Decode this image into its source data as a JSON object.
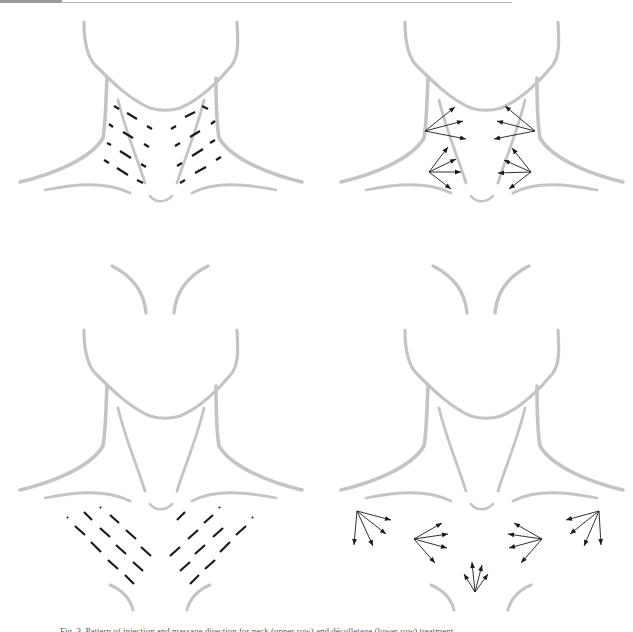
{
  "figure": {
    "caption": "Fig. 3. Pattern of injection and massage direction for neck (upper row) and décolletage (lower row) treatment.",
    "colors": {
      "outline": "#c4c4c4",
      "marks": "#1a1a1a",
      "background": "#ffffff"
    },
    "panels": [
      {
        "id": "top-left",
        "label": "neck-injection-lines",
        "x": 0,
        "y": 0,
        "show_upper_chin": false,
        "dashes": [
          [
            114,
            106,
            119,
            109
          ],
          [
            127,
            113,
            137,
            119
          ],
          [
            147,
            126,
            152,
            129
          ],
          [
            109,
            124,
            113,
            127
          ],
          [
            123,
            132,
            133,
            138
          ],
          [
            144,
            144,
            149,
            147
          ],
          [
            107,
            143,
            111,
            145
          ],
          [
            120,
            151,
            131,
            158
          ],
          [
            141,
            164,
            146,
            167
          ],
          [
            104,
            160,
            109,
            163
          ],
          [
            117,
            168,
            128,
            175
          ],
          [
            137,
            180,
            143,
            183
          ],
          [
            202,
            106,
            208,
            109
          ],
          [
            185,
            117,
            195,
            112
          ],
          [
            171,
            129,
            176,
            126
          ],
          [
            211,
            124,
            215,
            121
          ],
          [
            190,
            137,
            200,
            131
          ],
          [
            175,
            146,
            180,
            143
          ],
          [
            210,
            143,
            215,
            140
          ],
          [
            192,
            156,
            203,
            149
          ],
          [
            177,
            166,
            182,
            163
          ],
          [
            216,
            160,
            221,
            157
          ],
          [
            195,
            173,
            206,
            167
          ],
          [
            180,
            183,
            185,
            180
          ]
        ],
        "arrows": []
      },
      {
        "id": "top-right",
        "label": "neck-massage-direction",
        "x": 321,
        "y": 0,
        "show_upper_chin": false,
        "dashes": [],
        "arrows": [
          {
            "from": [
              104,
              131
            ],
            "to": [
              [
                134,
                107
              ],
              [
                142,
                121
              ],
              [
                145,
                139
              ]
            ]
          },
          {
            "from": [
              108,
              172
            ],
            "to": [
              [
                127,
                147
              ],
              [
                135,
                159
              ],
              [
                140,
                172
              ],
              [
                130,
                189
              ]
            ]
          },
          {
            "from": [
              214,
              131
            ],
            "to": [
              [
                184,
                106
              ],
              [
                176,
                121
              ],
              [
                173,
                139
              ]
            ]
          },
          {
            "from": [
              210,
              172
            ],
            "to": [
              [
                191,
                148
              ],
              [
                183,
                160
              ],
              [
                177,
                173
              ],
              [
                188,
                189
              ]
            ]
          }
        ]
      },
      {
        "id": "bottom-left",
        "label": "decolletage-injection-lines",
        "x": 0,
        "y": 250,
        "show_upper_chin": true,
        "dashes": [
          [
            67,
            267,
            68,
            268
          ],
          [
            84,
            262,
            92,
            270
          ],
          [
            100,
            257,
            101,
            258
          ],
          [
            110,
            265,
            119,
            273
          ],
          [
            75,
            276,
            85,
            285
          ],
          [
            100,
            278,
            110,
            287
          ],
          [
            126,
            280,
            136,
            289
          ],
          [
            91,
            292,
            101,
            302
          ],
          [
            116,
            295,
            126,
            304
          ],
          [
            141,
            297,
            151,
            306
          ],
          [
            108,
            310,
            118,
            319
          ],
          [
            133,
            312,
            143,
            321
          ],
          [
            125,
            325,
            134,
            334
          ],
          [
            219,
            257,
            220,
            258
          ],
          [
            177,
            270,
            185,
            262
          ],
          [
            252,
            267,
            253,
            268
          ],
          [
            204,
            273,
            213,
            265
          ],
          [
            188,
            289,
            198,
            280
          ],
          [
            213,
            287,
            223,
            278
          ],
          [
            236,
            285,
            246,
            276
          ],
          [
            170,
            306,
            180,
            297
          ],
          [
            195,
            304,
            205,
            295
          ],
          [
            220,
            302,
            230,
            292
          ],
          [
            180,
            321,
            190,
            312
          ],
          [
            205,
            319,
            215,
            310
          ],
          [
            190,
            334,
            199,
            325
          ]
        ],
        "arrows": []
      },
      {
        "id": "bottom-right",
        "label": "decolletage-massage-direction",
        "x": 321,
        "y": 250,
        "show_upper_chin": true,
        "dashes": [],
        "arrows": [
          {
            "from": [
              36,
              261
            ],
            "to": [
              [
                70,
                270
              ],
              [
                65,
                284
              ],
              [
                52,
                296
              ],
              [
                33,
                295
              ]
            ]
          },
          {
            "from": [
              93,
              289
            ],
            "to": [
              [
                121,
                273
              ],
              [
                127,
                284
              ],
              [
                126,
                298
              ],
              [
                114,
                313
              ]
            ]
          },
          {
            "from": [
              221,
              289
            ],
            "to": [
              [
                193,
                273
              ],
              [
                187,
                284
              ],
              [
                188,
                298
              ],
              [
                200,
                313
              ]
            ]
          },
          {
            "from": [
              278,
              261
            ],
            "to": [
              [
                245,
                270
              ],
              [
                249,
                284
              ],
              [
                263,
                296
              ],
              [
                280,
                295
              ]
            ]
          },
          {
            "from": [
              154,
              342
            ],
            "to": [
              [
                143,
                324
              ],
              [
                151,
                312
              ],
              [
                161,
                315
              ],
              [
                167,
                324
              ]
            ]
          }
        ]
      }
    ]
  }
}
